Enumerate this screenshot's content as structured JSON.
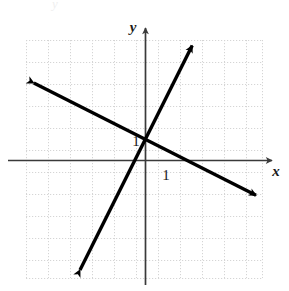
{
  "figure": {
    "kind": "coordinate-graph",
    "background_color": "#ffffff",
    "axis_color": "#3a3a3a",
    "grid_color": "#d9d9d9",
    "line_color": "#000000",
    "labels": {
      "x_axis": "x",
      "y_axis": "y",
      "x_unit_tick": "1",
      "y_unit_tick": "1"
    },
    "bleed_through": {
      "top_text": "y",
      "band_text": ""
    }
  },
  "chart_data": {
    "type": "line",
    "title": "",
    "xlabel": "x",
    "ylabel": "y",
    "grid": true,
    "legend": "none",
    "xlim": [
      -5.5,
      5.5
    ],
    "ylim": [
      -5.4,
      5.5
    ],
    "xticks": [
      1
    ],
    "yticks": [
      1
    ],
    "xtick_labels": [
      "1"
    ],
    "ytick_labels": [
      "1"
    ],
    "unit_pixels": 22,
    "origin_pixels": [
      146,
      160
    ],
    "intersection_point": [
      0,
      1
    ],
    "series": [
      {
        "name": "steep-rising-line",
        "type": "line",
        "style": "solid-double-arrow",
        "slope": 2,
        "intercept": 1,
        "equation": "y = 2x + 1",
        "endpoints": [
          [
            -3,
            -5
          ],
          [
            2.1,
            5.2
          ]
        ],
        "arrow_start": true,
        "arrow_end": true
      },
      {
        "name": "shallow-falling-line",
        "type": "line",
        "style": "solid-double-arrow",
        "slope": -0.55,
        "intercept": 1,
        "equation": "y = -0.55x + 1",
        "endpoints": [
          [
            -5.1,
            3.5
          ],
          [
            5.0,
            -1.6
          ]
        ],
        "arrow_start": true,
        "arrow_end": true
      }
    ],
    "grid_extent": {
      "x_from": -5.45,
      "x_to": 5.27,
      "y_from": -5.36,
      "y_to": 5.45,
      "columns": 11,
      "rows": 11
    }
  }
}
